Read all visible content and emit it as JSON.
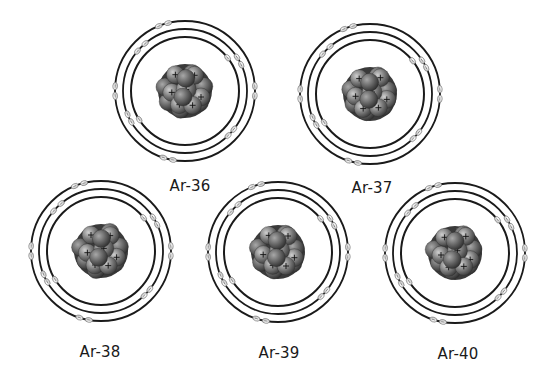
{
  "diagram": {
    "title": "",
    "type": "bohr-model-isotopes",
    "element": "Ar",
    "shell_config": [
      2,
      8,
      8
    ],
    "colors": {
      "background": "#ffffff",
      "orbit": "#1a1a1a",
      "electron_fill": "#e8e8e8",
      "electron_stroke": "#777777",
      "nucleus_dark": "#3a3a3a",
      "nucleus_mid": "#6e6e6e",
      "nucleus_light": "#b5b5b5",
      "label": "#1a1a1a"
    },
    "atoms": [
      {
        "id": "ar-36",
        "label": "Ar-36",
        "cx": 185,
        "cy": 91,
        "label_x": 190,
        "label_y": 186
      },
      {
        "id": "ar-37",
        "label": "Ar-37",
        "cx": 370,
        "cy": 94,
        "label_x": 372,
        "label_y": 188
      },
      {
        "id": "ar-38",
        "label": "Ar-38",
        "cx": 101,
        "cy": 251,
        "label_x": 100,
        "label_y": 352
      },
      {
        "id": "ar-39",
        "label": "Ar-39",
        "cx": 278,
        "cy": 252,
        "label_x": 279,
        "label_y": 353
      },
      {
        "id": "ar-40",
        "label": "Ar-40",
        "cx": 455,
        "cy": 253,
        "label_x": 458,
        "label_y": 354
      }
    ]
  }
}
